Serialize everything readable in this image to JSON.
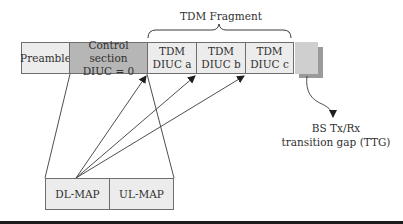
{
  "frame": {
    "preamble": "Preamble",
    "control_section": {
      "line1": "Control section",
      "line2": "DIUC = 0"
    },
    "tdm_a": {
      "line1": "TDM",
      "line2": "DIUC a"
    },
    "tdm_b": {
      "line1": "TDM",
      "line2": "DIUC b"
    },
    "tdm_c": {
      "line1": "TDM",
      "line2": "DIUC c"
    }
  },
  "fragment_label": "TDM Fragment",
  "maps": {
    "dl_map": "DL-MAP",
    "ul_map": "UL-MAP"
  },
  "ttg": {
    "line1": "BS Tx/Rx",
    "line2": "transition gap (TTG)"
  },
  "colors": {
    "light_cell": "#ececec",
    "control_cell": "#b6b6b6",
    "ttg_front": "#cfcfcf",
    "ttg_shadow": "#9a9a9a",
    "line": "#3a3a3a"
  }
}
